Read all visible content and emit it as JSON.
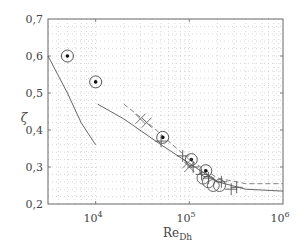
{
  "chart_data": {
    "type": "scatter",
    "title": "",
    "xlabel": "Re_Dh",
    "ylabel": "ζ",
    "xscale": "log",
    "xlim": [
      3100,
      1000000
    ],
    "ylim": [
      0.2,
      0.7
    ],
    "grid": "dotted, major and minor",
    "legend": null,
    "x_tick_labels": [
      "10^4",
      "10^5",
      "10^6"
    ],
    "y_tick_labels": [
      "0,2",
      "0,3",
      "0,4",
      "0,5",
      "0,6",
      "0,7"
    ],
    "series": [
      {
        "name": "dotted circles",
        "marker": "circle-with-dot",
        "points": [
          [
            5000,
            0.6
          ],
          [
            10000,
            0.53
          ],
          [
            52000,
            0.38
          ],
          [
            105000,
            0.32
          ],
          [
            150000,
            0.29
          ]
        ]
      },
      {
        "name": "open circles",
        "marker": "circle",
        "points": [
          [
            140000,
            0.27
          ],
          [
            160000,
            0.26
          ],
          [
            180000,
            0.25
          ],
          [
            210000,
            0.25
          ]
        ]
      },
      {
        "name": "crosses (x)",
        "marker": "x",
        "points": [
          [
            30000,
            0.43
          ],
          [
            35000,
            0.42
          ],
          [
            95000,
            0.31
          ],
          [
            100000,
            0.3
          ]
        ]
      },
      {
        "name": "plus markers",
        "marker": "+",
        "points": [
          [
            50000,
            0.37
          ],
          [
            85000,
            0.33
          ],
          [
            110000,
            0.3
          ],
          [
            135000,
            0.28
          ],
          [
            160000,
            0.27
          ],
          [
            220000,
            0.26
          ],
          [
            280000,
            0.24
          ],
          [
            320000,
            0.245
          ]
        ]
      },
      {
        "name": "solid curve (low Re)",
        "style": "solid",
        "points": [
          [
            3100,
            0.6
          ],
          [
            5000,
            0.5
          ],
          [
            7000,
            0.42
          ],
          [
            10000,
            0.36
          ]
        ]
      },
      {
        "name": "solid curve (high Re)",
        "style": "solid",
        "points": [
          [
            10500,
            0.47
          ],
          [
            20000,
            0.43
          ],
          [
            50000,
            0.36
          ],
          [
            100000,
            0.31
          ],
          [
            200000,
            0.26
          ],
          [
            400000,
            0.24
          ],
          [
            1000000,
            0.235
          ]
        ]
      },
      {
        "name": "dashed curve",
        "style": "dashed",
        "points": [
          [
            20000,
            0.47
          ],
          [
            40000,
            0.41
          ],
          [
            100000,
            0.32
          ],
          [
            200000,
            0.27
          ],
          [
            400000,
            0.255
          ],
          [
            1000000,
            0.255
          ]
        ]
      }
    ]
  },
  "axes": {
    "y_label": "ζ",
    "x_label_main": "Re",
    "x_label_sub": "Dh",
    "y_ticks": [
      {
        "label": "0,7",
        "y": 19
      },
      {
        "label": "0,6",
        "y": 56
      },
      {
        "label": "0,5",
        "y": 93
      },
      {
        "label": "0,4",
        "y": 130
      },
      {
        "label": "0,3",
        "y": 167
      },
      {
        "label": "0,2",
        "y": 204
      }
    ],
    "x_ticks": [
      {
        "base": "10",
        "exp": "4",
        "x": 96
      },
      {
        "base": "10",
        "exp": "5",
        "x": 189
      },
      {
        "base": "10",
        "exp": "6",
        "x": 283
      }
    ]
  }
}
